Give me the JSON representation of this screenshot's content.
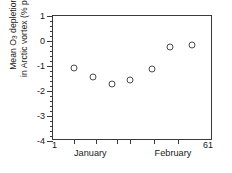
{
  "chart_data": {
    "type": "scatter",
    "title": "",
    "ylabel_line1": "Mean O3 depletion rate",
    "ylabel_line2": "in Arctic vortex (% per day)",
    "ylabel_sub": "3",
    "ylabel_main_pre": "Mean O",
    "ylabel_main_post": " depletion rate",
    "xlabel": "",
    "xlim": [
      1,
      61
    ],
    "ylim": [
      -4,
      1
    ],
    "y_major_ticks": [
      1,
      0,
      -1,
      -2,
      -3,
      -4
    ],
    "y_tick_labels": [
      "1",
      "0",
      "-1",
      "-2",
      "-3",
      "-4"
    ],
    "y_minor_step": 0.2,
    "x_axis_left_label": "1",
    "x_axis_right_label": "61",
    "x_month_labels": [
      "January",
      "February"
    ],
    "x_month_positions": [
      15,
      46
    ],
    "x_tick_positions": [
      9,
      17,
      25,
      30,
      39,
      48
    ],
    "grid": false,
    "legend": null,
    "marker": "open-circle",
    "marker_color": "#4a4a4a",
    "x": [
      9,
      16,
      23,
      30,
      38,
      45,
      53
    ],
    "values": [
      -1.08,
      -1.45,
      -1.7,
      -1.55,
      -1.12,
      -0.23,
      -0.15
    ],
    "points": [
      {
        "x": 9,
        "y": -1.08
      },
      {
        "x": 16,
        "y": -1.45
      },
      {
        "x": 23,
        "y": -1.7
      },
      {
        "x": 30,
        "y": -1.55
      },
      {
        "x": 38,
        "y": -1.12
      },
      {
        "x": 45,
        "y": -0.23
      },
      {
        "x": 53,
        "y": -0.15
      }
    ]
  }
}
